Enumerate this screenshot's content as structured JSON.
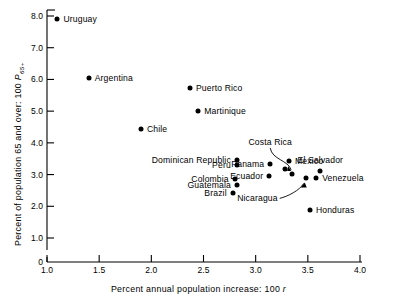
{
  "chart_data": {
    "type": "scatter",
    "title": "",
    "xlabel": "Percent annual population increase: 100 r",
    "ylabel": "Percent of population 65 and over: 100 P65+",
    "ylabel_main": "Percent of population 65 and over: 100 ",
    "ylabel_sym": "P",
    "ylabel_sub": "65+",
    "xlabel_main": "Percent annual population increase: 100 ",
    "xlabel_sym": "r",
    "xlim": [
      1.0,
      4.0
    ],
    "ylim": [
      0,
      8.0
    ],
    "grid": false,
    "legend": "none",
    "xticks": [
      "1.0",
      "1.5",
      "2.0",
      "2.5",
      "3.0",
      "3.5",
      "4.0"
    ],
    "xtick_values": [
      1.0,
      1.5,
      2.0,
      2.5,
      3.0,
      3.5,
      4.0
    ],
    "yticks": [
      "0",
      "1.0",
      "2.0",
      "3.0",
      "4.0",
      "5.0",
      "6.0",
      "7.0",
      "8.0"
    ],
    "ytick_values": [
      0,
      1.0,
      2.0,
      3.0,
      4.0,
      5.0,
      6.0,
      7.0,
      8.0
    ],
    "axis_break": true,
    "points": [
      {
        "name": "Uruguay",
        "x": 1.1,
        "y": 7.9,
        "label_pos": "right"
      },
      {
        "name": "Argentina",
        "x": 1.4,
        "y": 6.05,
        "label_pos": "right"
      },
      {
        "name": "Chile",
        "x": 1.9,
        "y": 4.45,
        "label_pos": "right"
      },
      {
        "name": "Puerto Rico",
        "x": 2.37,
        "y": 5.72,
        "label_pos": "right"
      },
      {
        "name": "Martinique",
        "x": 2.45,
        "y": 5.02,
        "label_pos": "right"
      },
      {
        "name": "Dominican Republic",
        "x": 2.82,
        "y": 3.45,
        "label_pos": "left"
      },
      {
        "name": "Peru",
        "x": 2.82,
        "y": 3.3,
        "label_pos": "left"
      },
      {
        "name": "Colombia",
        "x": 2.8,
        "y": 2.85,
        "label_pos": "left"
      },
      {
        "name": "Guatemala",
        "x": 2.82,
        "y": 2.67,
        "label_pos": "left"
      },
      {
        "name": "Brazil",
        "x": 2.78,
        "y": 2.42,
        "label_pos": "left"
      },
      {
        "name": "Panama",
        "x": 3.14,
        "y": 3.32,
        "label_pos": "left"
      },
      {
        "name": "Ecuador",
        "x": 3.13,
        "y": 2.95,
        "label_pos": "left"
      },
      {
        "name": "Costa Rica",
        "x": 3.35,
        "y": 3.02,
        "label_pos": "leader-up"
      },
      {
        "name": "Mexico",
        "x": 3.32,
        "y": 3.42,
        "label_pos": "right"
      },
      {
        "name": "Mexico2",
        "x": 3.28,
        "y": 3.17,
        "label_pos": "none"
      },
      {
        "name": "Nicaragua",
        "x": 3.48,
        "y": 2.88,
        "label_pos": "leader-down"
      },
      {
        "name": "Venezuela",
        "x": 3.58,
        "y": 2.88,
        "label_pos": "right"
      },
      {
        "name": "El Salvador",
        "x": 3.62,
        "y": 3.12,
        "label_pos": "above"
      },
      {
        "name": "Honduras",
        "x": 3.52,
        "y": 1.88,
        "label_pos": "right"
      }
    ]
  },
  "labels": {
    "uruguay": "Uruguay",
    "argentina": "Argentina",
    "chile": "Chile",
    "puerto_rico": "Puerto Rico",
    "martinique": "Martinique",
    "dominican_republic": "Dominican Republic",
    "peru": "Peru",
    "colombia": "Colombia",
    "guatemala": "Guatemala",
    "brazil": "Brazil",
    "panama": "Panama",
    "ecuador": "Ecuador",
    "costa_rica": "Costa Rica",
    "mexico": "Mexico",
    "nicaragua": "Nicaragua",
    "venezuela": "Venezuela",
    "el_salvador": "El Salvador",
    "honduras": "Honduras"
  }
}
